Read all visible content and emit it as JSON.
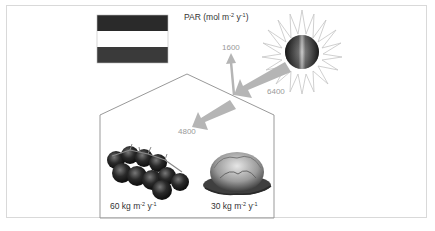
{
  "diagram": {
    "title": "PAR",
    "title_units": "(mol m",
    "title_units_exp1": "-2",
    "title_units_mid": " y",
    "title_units_exp2": "-1",
    "title_units_end": ")",
    "flag": {
      "country": "Netherlands",
      "stripes": [
        "#2a2a2a",
        "#ffffff",
        "#3a3a3a"
      ]
    },
    "light_source": {
      "name": "sun",
      "ray_color": "#cfcfcf",
      "core_gradient": [
        "#111111",
        "#f0f0f0",
        "#222222"
      ]
    },
    "fluxes": {
      "incoming": "6400",
      "reflected": "1600",
      "transmitted": "4800",
      "arrow_color": "#b5b5b5",
      "label_color": "#9a9a9a"
    },
    "greenhouse": {
      "outline_color": "#999999"
    },
    "crops": [
      {
        "name": "tomato",
        "yield_value": "60 kg m",
        "yield_exp1": "-2",
        "yield_mid": " y",
        "yield_exp2": "-1"
      },
      {
        "name": "lettuce",
        "yield_value": "30 kg m",
        "yield_exp1": "-2",
        "yield_mid": " y",
        "yield_exp2": "-1"
      }
    ]
  }
}
